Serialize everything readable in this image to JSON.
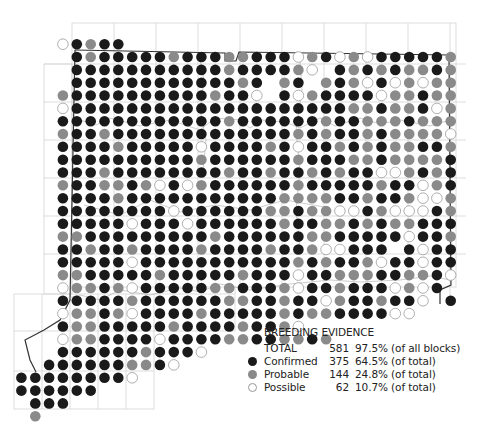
{
  "map": {
    "grid": {
      "x0": 21.4,
      "dx": 13.85,
      "y0": 44.2,
      "dy": 12.83,
      "r": 5.3
    },
    "colors": {
      "confirmed": "#1a1a1a",
      "probable": "#8a8a8a",
      "possible": "#ffffff",
      "possible_stroke": "#9a9a9a",
      "gridline": "#d4d4d4",
      "border": "#333333"
    },
    "codes": {
      "B": "confirmed",
      "G": "probable",
      "O": "possible",
      ".": "none"
    },
    "rows": [
      "...OBGBB........................",
      "....BGBBBBBGBBBGGBBBOGBOGOBBBBBG",
      "....BBBBBBBBBBBGBBBBGO.BGBGBGGBGOO",
      "....BBBBBBBBBBBBGB.GB.GBGOBOGOGGBOBB",
      "...GBBBBBBBBBBGBBO.BOGBBBBOGGBGGGGB",
      "...OBBBBBBBBBBBBBBBBBBBBGGBGGBOGO",
      "...BBBBBBBBBBBBGBBBBBBGBBGGGBGGGBGB",
      "...GBBGBBBBBBBBBBBBBGBGBBGBGGGGOGO",
      "...BBBBGBBBBBOBBBBGBOBBGBGBGGBBGGB",
      "...BBBBBBBBBBGBBBBBBGBBBGGBGGGGBBOB",
      "...BBBGBBBBBBBBGBBGBBGBGBBOOGBGBGB",
      "...GBBGGBGOBOGBBBBBBGBBBBBGBBOGBB",
      "...BBBBGBBBBBBBBBBBGGGGBBGBBGOOGOG",
      "...BBBBBBBBOBBBBBBGGBGGOOBGOOOBGB",
      "...BBBBBOBBBOBBBBBBGBBGGBGBGGBBBB",
      "...GGBBBBBBBBBGBBBBBBGGBBBBBOBBGB",
      "...BBGBBGBBBBGBBBBGBBGOOBBB.BOBBG",
      "...BBBBBOBBBBBBBBBBBGBGBBGOBBOBBB",
      "...GGBBBBBGBBBBBGBBBOBBGGGBBGGBO",
      "...OGGBGOBBBBBGGBBBGOBBGBBBOGOB.",
      "...BBBBBGBBBBBBGGBBGBBOGBBGBBO.B",
      "...OGGBGOBBBBGBBBBBGBGGBBBBOO...",
      "...BGGBBBBBGBBBBGBBGO...........",
      "...OGGBBBBOBBBBGGBBGGBG.........",
      "...BBBBBBGBBBO..................",
      "..BBBBBBGGBO....................",
      "BBBBBBBBO.......................",
      "BBBBBB..........................",
      ".BBB............................",
      ".G.............................."
    ]
  },
  "legend": {
    "title": "BREEDING EVIDENCE",
    "total": {
      "label": "TOTAL",
      "count": "581",
      "pct": "97.5% (of all blocks)"
    },
    "items": [
      {
        "label": "Confirmed",
        "count": "375",
        "pct": "64.5% (of total)",
        "type": "confirmed"
      },
      {
        "label": "Probable",
        "count": "144",
        "pct": "24.8% (of total)",
        "type": "probable"
      },
      {
        "label": "Possible",
        "count": "62",
        "pct": "10.7% (of total)",
        "type": "possible"
      }
    ]
  }
}
